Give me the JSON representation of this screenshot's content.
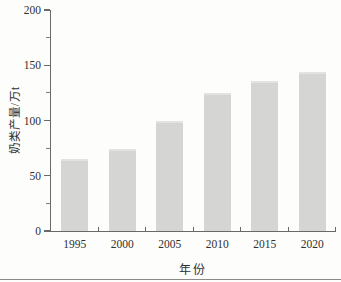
{
  "chart_data": {
    "type": "bar",
    "title": "",
    "categories": [
      "1995",
      "2000",
      "2005",
      "2010",
      "2015",
      "2020"
    ],
    "values": [
      65,
      74,
      100,
      125,
      136,
      144
    ],
    "xlabel": "年份",
    "ylabel": "奶类产量/万t",
    "ylim": [
      0,
      200
    ],
    "yticks_major": [
      0,
      50,
      100,
      150,
      200
    ],
    "yticks_minor": [
      25,
      75,
      125,
      175
    ],
    "grid": false,
    "legend": "none",
    "bar_width_px": 27,
    "colors": {
      "bar": "#d5d5d3",
      "axis": "#696969",
      "text": "#2f2f2f",
      "background": "#fdfdfb"
    }
  }
}
